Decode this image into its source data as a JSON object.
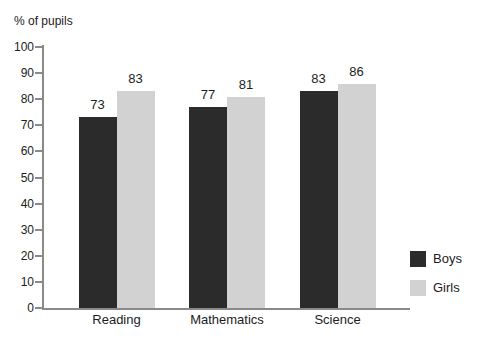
{
  "chart_data": {
    "type": "bar",
    "title": "",
    "ylabel": "% of pupils",
    "xlabel": "",
    "categories": [
      "Reading",
      "Mathematics",
      "Science"
    ],
    "series": [
      {
        "name": "Boys",
        "color": "#2b2b2b",
        "values": [
          73,
          77,
          83
        ]
      },
      {
        "name": "Girls",
        "color": "#d2d2d2",
        "values": [
          83,
          81,
          86
        ]
      }
    ],
    "ylim": [
      0,
      100
    ],
    "yticks": [
      0,
      10,
      20,
      30,
      40,
      50,
      60,
      70,
      80,
      90,
      100
    ],
    "grid": false,
    "value_labels": true,
    "legend_position": "bottom-right"
  },
  "colors": {
    "axis": "#8a8a8a",
    "text": "#1c1c1c",
    "background": "#ffffff"
  }
}
